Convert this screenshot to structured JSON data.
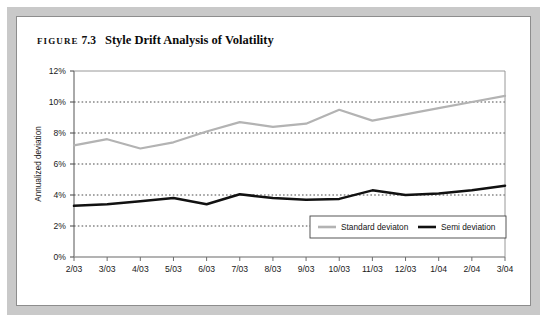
{
  "figure": {
    "label_word": "FIGURE",
    "number": "7.3",
    "title": "Style Drift Analysis of Volatility"
  },
  "chart_data": {
    "type": "line",
    "title": "Style Drift Analysis of Volatility",
    "xlabel": "",
    "ylabel": "Annualized deviation",
    "categories": [
      "2/03",
      "3/03",
      "4/03",
      "5/03",
      "6/03",
      "7/03",
      "8/03",
      "9/03",
      "10/03",
      "11/03",
      "12/03",
      "1/04",
      "2/04",
      "3/04"
    ],
    "ylim": [
      0,
      12
    ],
    "ytick_values": [
      0,
      2,
      4,
      6,
      8,
      10,
      12
    ],
    "ytick_labels": [
      "0%",
      "2%",
      "4%",
      "6%",
      "8%",
      "10%",
      "12%"
    ],
    "grid": true,
    "grid_style": "dotted-horizontal",
    "legend_position": "inside-bottom-right",
    "series": [
      {
        "name": "Standard deviaton",
        "color": "#b3b3b3",
        "values": [
          7.2,
          7.6,
          7.0,
          7.4,
          8.1,
          8.7,
          8.4,
          8.6,
          9.5,
          8.8,
          9.2,
          9.6,
          10.0,
          10.4
        ]
      },
      {
        "name": "Semi deviation",
        "color": "#111111",
        "values": [
          3.3,
          3.4,
          3.6,
          3.8,
          3.4,
          4.05,
          3.8,
          3.7,
          3.75,
          4.3,
          4.0,
          4.1,
          4.3,
          4.6
        ]
      }
    ]
  },
  "legend": {
    "items": [
      {
        "label": "Standard deviaton",
        "color": "#b3b3b3"
      },
      {
        "label": "Semi deviation",
        "color": "#111111"
      }
    ]
  }
}
